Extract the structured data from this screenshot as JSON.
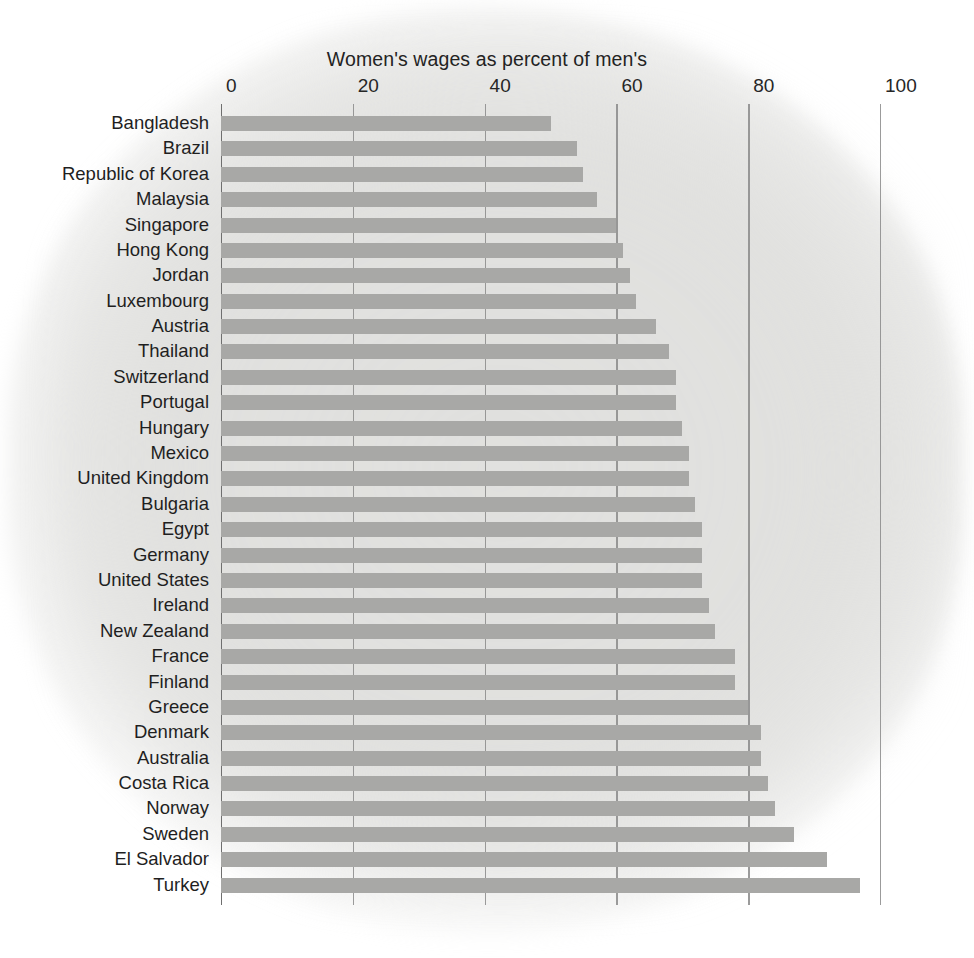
{
  "chart_data": {
    "type": "bar",
    "orientation": "horizontal",
    "title": "Women's wages as percent of men's",
    "xlabel": "",
    "ylabel": "",
    "xlim": [
      0,
      100
    ],
    "xticks": [
      0,
      20,
      40,
      60,
      80,
      100
    ],
    "xtick_labels": [
      "0",
      "20",
      "40",
      "60",
      "80",
      "100"
    ],
    "grid": "vertical-only",
    "legend": "none",
    "bar_color": "#a8a8a6",
    "background_color": "#e3e3e1",
    "categories": [
      "Bangladesh",
      "Brazil",
      "Republic of Korea",
      "Malaysia",
      "Singapore",
      "Hong Kong",
      "Jordan",
      "Luxembourg",
      "Austria",
      "Thailand",
      "Switzerland",
      "Portugal",
      "Hungary",
      "Mexico",
      "United Kingdom",
      "Bulgaria",
      "Egypt",
      "Germany",
      "United States",
      "Ireland",
      "New Zealand",
      "France",
      "Finland",
      "Greece",
      "Denmark",
      "Australia",
      "Costa Rica",
      "Norway",
      "Sweden",
      "El Salvador",
      "Turkey"
    ],
    "values": [
      50,
      54,
      55,
      57,
      60,
      61,
      62,
      63,
      66,
      68,
      69,
      69,
      70,
      71,
      71,
      72,
      73,
      73,
      73,
      74,
      75,
      78,
      78,
      80,
      82,
      82,
      83,
      84,
      87,
      92,
      97
    ]
  },
  "axis": {
    "tick_color": "#8a8a8a",
    "label_color": "#262626"
  }
}
